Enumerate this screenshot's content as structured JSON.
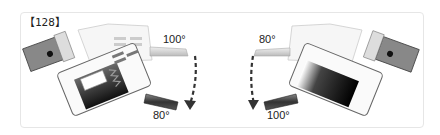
{
  "figure": {
    "label": "【128】",
    "left_view": {
      "start_angle": "100°",
      "end_angle": "80°",
      "arrow_direction": "down-clockwise"
    },
    "right_view": {
      "start_angle": "80°",
      "end_angle": "100°",
      "arrow_direction": "down-counterclockwise"
    }
  }
}
